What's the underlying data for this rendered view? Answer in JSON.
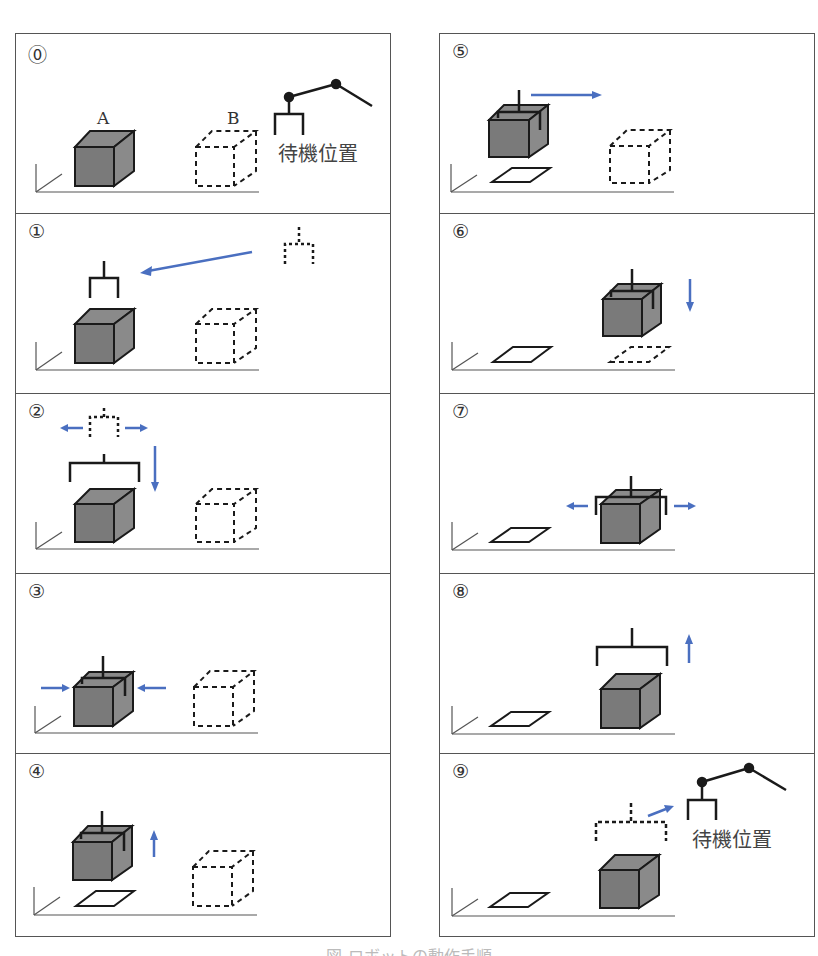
{
  "figure": {
    "caption": "図 ロボットの動作手順",
    "colors": {
      "arrow": "#4a6fc0",
      "box_front": "#7a7a7a",
      "box_side": "#8a8a8a",
      "outline": "#1a1a1a",
      "border": "#555555"
    }
  },
  "labels": {
    "box_a": "A",
    "box_b": "B",
    "standby": "待機位置"
  },
  "steps": [
    {
      "num": "⓪",
      "description": "Initial state: box A at origin, target B (dashed), robot arm at standby position"
    },
    {
      "num": "①",
      "description": "Gripper moves from standby to above box A"
    },
    {
      "num": "②",
      "description": "Gripper opens and descends"
    },
    {
      "num": "③",
      "description": "Gripper closes on box A"
    },
    {
      "num": "④",
      "description": "Box A lifted"
    },
    {
      "num": "⑤",
      "description": "Box moved toward position B"
    },
    {
      "num": "⑥",
      "description": "Box lowered onto position B"
    },
    {
      "num": "⑦",
      "description": "Gripper opens"
    },
    {
      "num": "⑧",
      "description": "Gripper raised"
    },
    {
      "num": "⑨",
      "description": "Gripper returns to standby position"
    }
  ]
}
